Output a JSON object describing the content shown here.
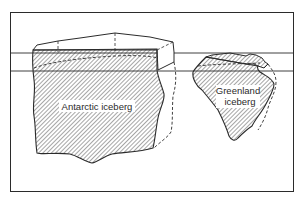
{
  "figure": {
    "type": "diagram",
    "colors": {
      "ink": "#2b2b2b",
      "background": "#ffffff",
      "hatch": "#3a3a3a"
    },
    "labels": {
      "antarctic": "Antarctic iceberg",
      "greenland_line1": "Greenland",
      "greenland_line2": "iceberg"
    }
  }
}
